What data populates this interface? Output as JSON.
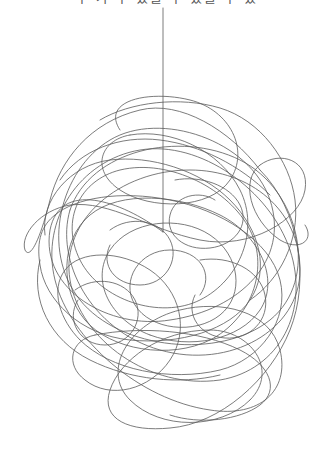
{
  "caption": {
    "text": "수 가 수 있을 수 있을 수 있",
    "clipped": true
  },
  "illustration": {
    "subject": "tangled-scribble-ball-on-string",
    "stroke_color": "#5a5a5a",
    "background": "#ffffff",
    "string": {
      "x": 163,
      "y_top": 8,
      "y_bottom": 232
    },
    "ball_bounds": {
      "x_min": 20,
      "x_max": 310,
      "y_min": 97,
      "y_max": 430
    }
  }
}
